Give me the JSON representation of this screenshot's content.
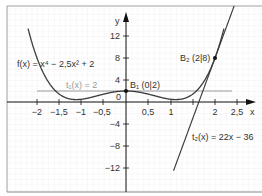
{
  "chart_data": {
    "type": "line",
    "title": "",
    "xlabel": "x",
    "ylabel": "y",
    "xlim": [
      -2.4,
      2.85
    ],
    "ylim": [
      -15,
      17
    ],
    "grid": true,
    "x_ticks": [
      -2,
      -1.5,
      -1,
      -0.5,
      0.5,
      1,
      2,
      2.5
    ],
    "x_tick_labels": [
      "−2",
      "−1,5",
      "−1",
      "−0,5",
      "0,5",
      "1",
      "2",
      "2,5"
    ],
    "y_ticks": [
      12,
      8,
      4,
      -4,
      -8,
      -12
    ],
    "y_tick_labels": [
      "12",
      "8",
      "4",
      "−4",
      "−8",
      "−12"
    ],
    "origin_label": "0",
    "series": [
      {
        "name": "f(x) = x⁴ − 2,5x² + 2",
        "expr": "x^4 - 2.5x^2 + 2",
        "color": "#3a3a3a"
      },
      {
        "name": "t₁(x) = 2",
        "expr": "2",
        "color": "#9a9a9a"
      },
      {
        "name": "t₂(x) = 22x − 36",
        "expr": "22x - 36",
        "color": "#3a3a3a"
      }
    ],
    "points": [
      {
        "label": "B₁ (0|2)",
        "x": 0,
        "y": 2
      },
      {
        "label": "B₂ (2|8)",
        "x": 2,
        "y": 8
      }
    ]
  },
  "labels": {
    "f": "f(x) = x⁴ − 2,5x² + 2",
    "t1": "t₁(x) = 2",
    "t2": "t₂(x) = 22x − 36",
    "b1": "B₁ (0|2)",
    "b2": "B₂ (2|8)",
    "xaxis": "x",
    "yaxis": "y",
    "origin": "0",
    "xt": [
      "−2",
      "−1,5",
      "−1",
      "−0,5",
      "0,5",
      "1",
      "2",
      "2,5"
    ],
    "yt": [
      "12",
      "8",
      "4",
      "−4",
      "−8",
      "−12"
    ]
  }
}
